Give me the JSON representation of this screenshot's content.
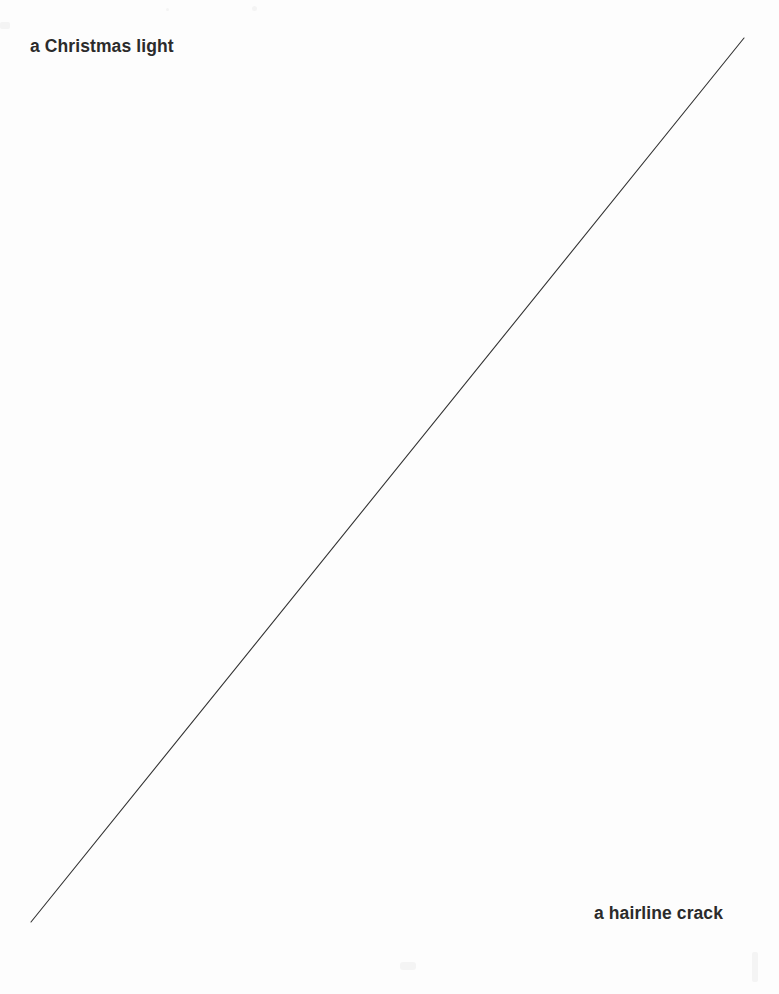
{
  "page": {
    "width": 779,
    "height": 994,
    "background_color": "#fdfdfd"
  },
  "captions": {
    "top_left": "a Christmas light",
    "bottom_right": "a hairline crack"
  },
  "diagram": {
    "line_color": "#333333",
    "line_width": 1.1,
    "start_x": 31,
    "start_y": 922,
    "end_x": 744,
    "end_y": 38
  },
  "chart_data": {
    "type": "line",
    "title": "",
    "subtitle": "",
    "xlabel": "",
    "ylabel": "",
    "grid": false,
    "legend_position": "none",
    "annotations": [
      {
        "text": "a Christmas light",
        "x": 30,
        "y": 50,
        "align": "left"
      },
      {
        "text": "a hairline crack",
        "x": 748,
        "y": 922,
        "align": "right"
      }
    ],
    "series": [
      {
        "name": "diagonal",
        "color": "#333333",
        "x": [
          31,
          744
        ],
        "values": [
          922,
          38
        ]
      }
    ],
    "xlim": [
      0,
      779
    ],
    "ylim": [
      994,
      0
    ]
  }
}
